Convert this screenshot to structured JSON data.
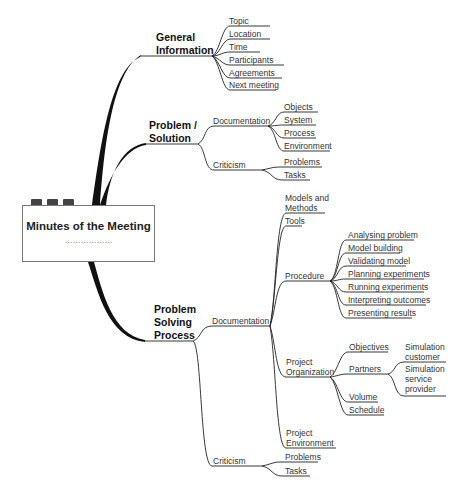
{
  "root": {
    "title": "Minutes of the Meeting",
    "placeholder": "………………"
  },
  "branches": {
    "general": {
      "label_line1": "General",
      "label_line2": "Information",
      "children": [
        "Topic",
        "Location",
        "Time",
        "Participants",
        "Agreements",
        "Next meeting"
      ]
    },
    "problem_solution": {
      "label_line1": "Problem /",
      "label_line2": "Solution",
      "documentation": {
        "label": "Documentation",
        "children": [
          "Objects",
          "System",
          "Process",
          "Environment"
        ]
      },
      "criticism": {
        "label": "Criticism",
        "children": [
          "Problems",
          "Tasks"
        ]
      }
    },
    "problem_solving": {
      "label_line1": "Problem",
      "label_line2": "Solving",
      "label_line3": "Process",
      "documentation": {
        "label": "Documentation",
        "models": {
          "line1": "Models and",
          "line2": "Methods"
        },
        "tools": "Tools",
        "procedure": {
          "label": "Procedure",
          "children": [
            "Analysing problem",
            "Model building",
            "Validating model",
            "Planning experiments",
            "Running experiments",
            "Interpreting outcomes",
            "Presenting results"
          ]
        },
        "project_org": {
          "line1": "Project",
          "line2": "Organization",
          "objectives": "Objectives",
          "partners": {
            "label": "Partners",
            "customer": {
              "line1": "Simulation",
              "line2": "customer"
            },
            "provider": {
              "line1": "Simulation",
              "line2": "service",
              "line3": "provider"
            }
          },
          "volume": "Volume",
          "schedule": "Schedule"
        },
        "project_env": {
          "line1": "Project",
          "line2": "Environment"
        }
      },
      "criticism": {
        "label": "Criticism",
        "children": [
          "Problems",
          "Tasks"
        ]
      }
    }
  },
  "colors": {
    "line": "#222222",
    "tab": "#444444",
    "box_border": "#777777"
  }
}
